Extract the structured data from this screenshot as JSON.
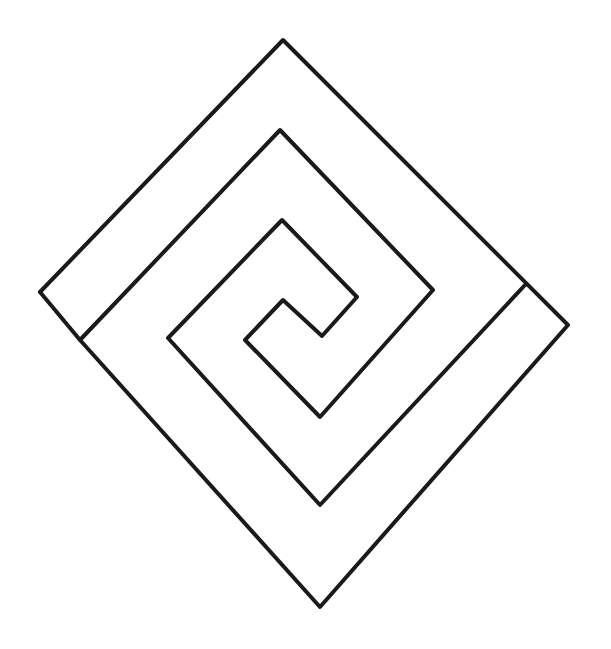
{
  "diagram": {
    "title": "",
    "background": "#ffffff",
    "stroke_color": "#1a1a1a",
    "stroke_width": 4,
    "shapes": [
      {
        "name": "square-spiral",
        "points": "40,292 283,40 568,325 320,607 80,340 280,130 433,290 320,417 245,340 283,300 322,336 357,297 282,220 168,338 320,505 525,285"
      },
      {
        "name": "left-end-cap",
        "points": "40,292 80,340"
      }
    ]
  }
}
